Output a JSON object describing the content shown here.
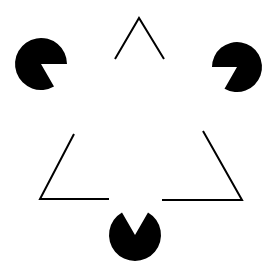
{
  "figure": {
    "colors": {
      "background": "#ffffff",
      "ink": "#000000"
    },
    "pacmen": [
      {
        "name": "top-left",
        "cx": 41,
        "cy": 64,
        "r": 26
      },
      {
        "name": "top-right",
        "cx": 237,
        "cy": 67,
        "r": 25
      },
      {
        "name": "bottom",
        "cx": 135,
        "cy": 235,
        "r": 26
      }
    ],
    "outline_segments": [
      {
        "name": "top-apex",
        "points": "115,59 139,18 164,59"
      },
      {
        "name": "left-corner",
        "points": "74,134 40,199 109,199"
      },
      {
        "name": "right-corner",
        "points": "203,131 242,200 162,200"
      }
    ]
  }
}
